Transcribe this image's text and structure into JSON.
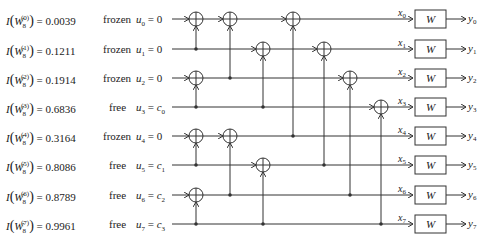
{
  "diagram": {
    "rows": [
      {
        "index": 0,
        "I_label": "I(W8(0))",
        "superscript": "(0)",
        "value": "0.0039",
        "status": "frozen",
        "u_label": "u0",
        "u_sub": "0",
        "assign": "0",
        "x_label": "x",
        "x_sub": "0",
        "y_label": "y",
        "y_sub": "0"
      },
      {
        "index": 1,
        "I_label": "I(W8(1))",
        "superscript": "(1)",
        "value": "0.1211",
        "status": "frozen",
        "u_label": "u1",
        "u_sub": "1",
        "assign": "0",
        "x_label": "x",
        "x_sub": "1",
        "y_label": "y",
        "y_sub": "1"
      },
      {
        "index": 2,
        "I_label": "I(W8(2))",
        "superscript": "(2)",
        "value": "0.1914",
        "status": "frozen",
        "u_label": "u2",
        "u_sub": "2",
        "assign": "0",
        "x_label": "x",
        "x_sub": "2",
        "y_label": "y",
        "y_sub": "2"
      },
      {
        "index": 3,
        "I_label": "I(W8(3))",
        "superscript": "(3)",
        "value": "0.6836",
        "status": "free",
        "u_label": "u3",
        "u_sub": "3",
        "assign": "c0",
        "assign_sub": "0",
        "x_label": "x",
        "x_sub": "3",
        "y_label": "y",
        "y_sub": "3"
      },
      {
        "index": 4,
        "I_label": "I(W8(4))",
        "superscript": "(4)",
        "value": "0.3164",
        "status": "frozen",
        "u_label": "u4",
        "u_sub": "4",
        "assign": "0",
        "x_label": "x",
        "x_sub": "4",
        "y_label": "y",
        "y_sub": "4"
      },
      {
        "index": 5,
        "I_label": "I(W8(5))",
        "superscript": "(5)",
        "value": "0.8086",
        "status": "free",
        "u_label": "u5",
        "u_sub": "5",
        "assign": "c1",
        "assign_sub": "1",
        "x_label": "x",
        "x_sub": "5",
        "y_label": "y",
        "y_sub": "5"
      },
      {
        "index": 6,
        "I_label": "I(W8(6))",
        "superscript": "(6)",
        "value": "0.8789",
        "status": "free",
        "u_label": "u6",
        "u_sub": "6",
        "assign": "c2",
        "assign_sub": "2",
        "x_label": "x",
        "x_sub": "6",
        "y_label": "y",
        "y_sub": "6"
      },
      {
        "index": 7,
        "I_label": "I(W8(7))",
        "superscript": "(7)",
        "value": "0.9961",
        "status": "free",
        "u_label": "u7",
        "u_sub": "7",
        "assign": "c3",
        "assign_sub": "3",
        "x_label": "x",
        "x_sub": "7",
        "y_label": "y",
        "y_sub": "7"
      }
    ],
    "channel_label": "W",
    "xor_nodes": [
      {
        "stage": 1,
        "target": 0,
        "control": 1
      },
      {
        "stage": 1,
        "target": 2,
        "control": 3
      },
      {
        "stage": 1,
        "target": 4,
        "control": 5
      },
      {
        "stage": 1,
        "target": 6,
        "control": 7
      },
      {
        "stage": 2,
        "target": 0,
        "control": 2
      },
      {
        "stage": 2,
        "target": 1,
        "control": 3
      },
      {
        "stage": 2,
        "target": 4,
        "control": 6
      },
      {
        "stage": 2,
        "target": 5,
        "control": 7
      },
      {
        "stage": 3,
        "target": 0,
        "control": 4
      },
      {
        "stage": 3,
        "target": 1,
        "control": 5
      },
      {
        "stage": 3,
        "target": 2,
        "control": 6
      },
      {
        "stage": 3,
        "target": 3,
        "control": 7
      }
    ],
    "colors": {
      "line": "#333333",
      "text": "#222222",
      "background": "#ffffff"
    }
  }
}
